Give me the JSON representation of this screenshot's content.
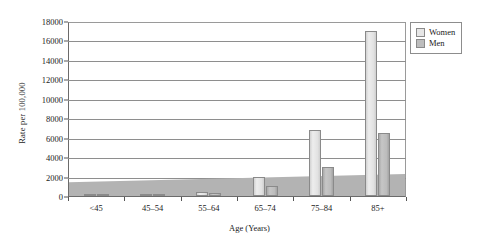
{
  "chart_data": {
    "type": "bar",
    "title": "",
    "xlabel": "Age (Years)",
    "ylabel": "Rate per 100,000",
    "categories": [
      "<45",
      "45–54",
      "55–64",
      "65–74",
      "75–84",
      "85+"
    ],
    "series": [
      {
        "name": "Women",
        "color": "#e6e6e6",
        "values": [
          50,
          150,
          450,
          2000,
          6800,
          17000
        ]
      },
      {
        "name": "Men",
        "color": "#bdbdbd",
        "values": [
          40,
          120,
          350,
          1000,
          3000,
          6500
        ]
      }
    ],
    "ylim": [
      0,
      18000
    ],
    "yticks": [
      0,
      2000,
      4000,
      6000,
      8000,
      10000,
      12000,
      14000,
      16000,
      18000
    ],
    "ytick_labels": [
      "0",
      "2000",
      "4000",
      "6000",
      "8000",
      "10000",
      "12000",
      "14000",
      "16000",
      "18000"
    ],
    "grid": true,
    "legend_position": "top-right",
    "style": "3d-column"
  },
  "legend": {
    "items": [
      {
        "label": "Women",
        "swatch": "legend-swatch-women"
      },
      {
        "label": "Men",
        "swatch": "legend-swatch-men"
      }
    ]
  }
}
